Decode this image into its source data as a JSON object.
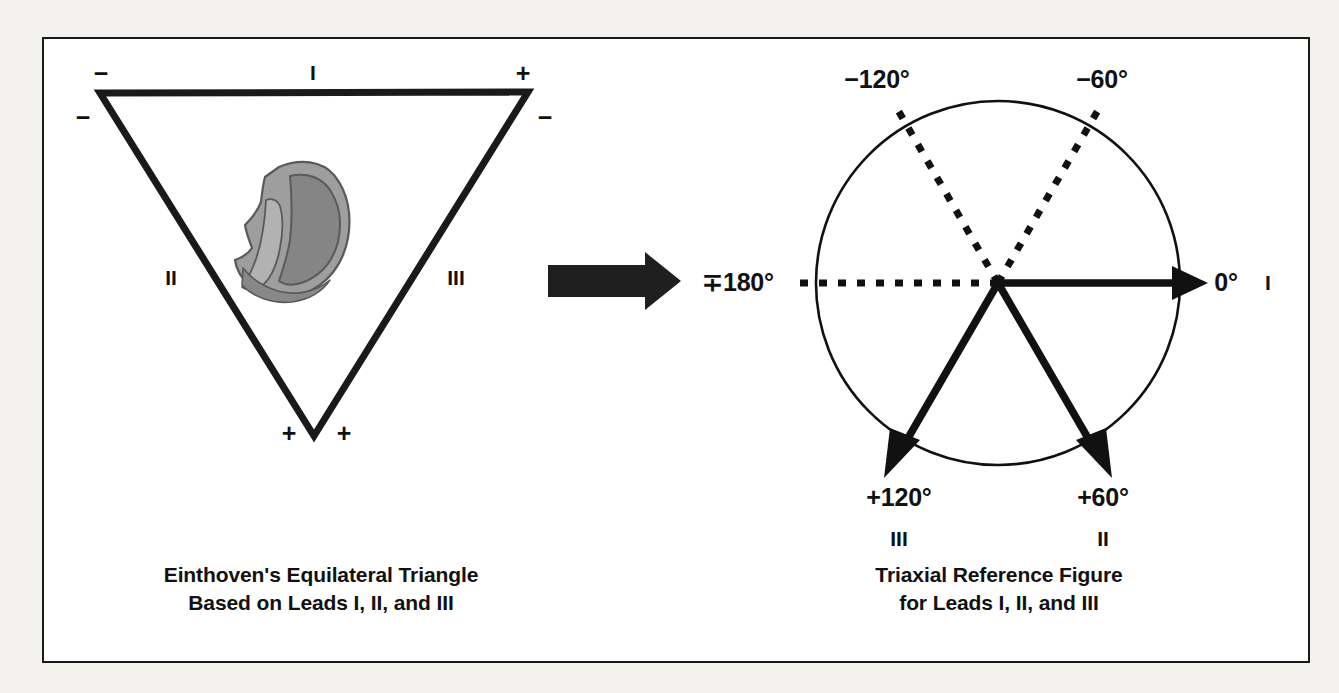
{
  "figure": {
    "background_color": "#f3f2ef",
    "panel_color": "#ffffff",
    "border_color": "#1a1a1a",
    "ink_color": "#111111"
  },
  "left_panel": {
    "caption_line1": "Einthoven's Equilateral Triangle",
    "caption_line2": "Based on Leads I, II, and III",
    "triangle": {
      "leads": [
        {
          "name": "I",
          "label": "I",
          "side": "top"
        },
        {
          "name": "II",
          "label": "II",
          "side": "left"
        },
        {
          "name": "III",
          "label": "III",
          "side": "right"
        }
      ],
      "polarity_markers": [
        {
          "label": "−",
          "at": "left-vertex-above",
          "meaning": "negative"
        },
        {
          "label": "−",
          "at": "left-vertex-below",
          "meaning": "negative"
        },
        {
          "label": "+",
          "at": "right-vertex-above",
          "meaning": "positive"
        },
        {
          "label": "−",
          "at": "right-vertex-below",
          "meaning": "negative"
        },
        {
          "label": "+",
          "at": "bottom-vertex-left",
          "meaning": "positive"
        },
        {
          "label": "+",
          "at": "bottom-vertex-right",
          "meaning": "positive"
        }
      ],
      "heart_illustration": {
        "name": "heart-cross-section",
        "fill_outer": "#9a9a9a",
        "fill_inner": "#8a8a8a",
        "fill_highlight": "#b4b4b4",
        "stroke": "#555555"
      }
    }
  },
  "transform_arrow": {
    "name": "right-arrow",
    "color": "#1f1f1f"
  },
  "right_panel": {
    "caption_line1": "Triaxial Reference Figure",
    "caption_line2": "for Leads I, II, and III",
    "circle": {
      "center_x": 998,
      "center_y": 283,
      "radius": 182,
      "stroke": "#111111"
    },
    "axes": [
      {
        "angle_label": "0°",
        "lead": "I",
        "degrees": 0,
        "style": "solid",
        "arrow": true,
        "label_pos": "right"
      },
      {
        "angle_label": "+60°",
        "lead": "II",
        "degrees": 60,
        "style": "solid",
        "arrow": true,
        "label_pos": "bottom-right"
      },
      {
        "angle_label": "+120°",
        "lead": "III",
        "degrees": 120,
        "style": "solid",
        "arrow": true,
        "label_pos": "bottom-left"
      },
      {
        "angle_label": "∓180°",
        "lead": "",
        "degrees": 180,
        "style": "dotted",
        "arrow": false,
        "label_pos": "left"
      },
      {
        "angle_label": "−120°",
        "lead": "",
        "degrees": -120,
        "style": "dotted",
        "arrow": false,
        "label_pos": "top-left"
      },
      {
        "angle_label": "−60°",
        "lead": "",
        "degrees": -60,
        "style": "dotted",
        "arrow": false,
        "label_pos": "top-right"
      }
    ]
  }
}
